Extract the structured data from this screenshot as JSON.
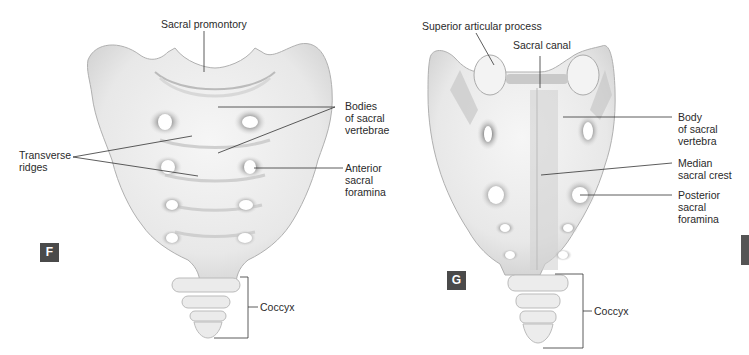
{
  "figures": [
    {
      "id": "F",
      "view": "anterior",
      "badge_label": "F",
      "labels": {
        "sacral_promontory": "Sacral promontory",
        "bodies_of_sacral_vertebrae": [
          "Bodies",
          "of sacral",
          "vertebrae"
        ],
        "transverse_ridges": [
          "Transverse",
          "ridges"
        ],
        "anterior_sacral_foramina": [
          "Anterior",
          "sacral",
          "foramina"
        ],
        "coccyx": "Coccyx"
      }
    },
    {
      "id": "G",
      "view": "posterior",
      "badge_label": "G",
      "labels": {
        "superior_articular_process": "Superior articular process",
        "sacral_canal": "Sacral canal",
        "body_of_sacral_vertebra": [
          "Body",
          "of sacral",
          "vertebra"
        ],
        "median_sacral_crest": [
          "Median",
          "sacral crest"
        ],
        "posterior_sacral_foramina": [
          "Posterior",
          "sacral",
          "foramina"
        ],
        "coccyx": "Coccyx"
      }
    }
  ],
  "colors": {
    "bone": "#ececec",
    "bone_shadow": "#b8b8b8",
    "leader_line": "#333333",
    "badge": "#4a4a4a"
  }
}
